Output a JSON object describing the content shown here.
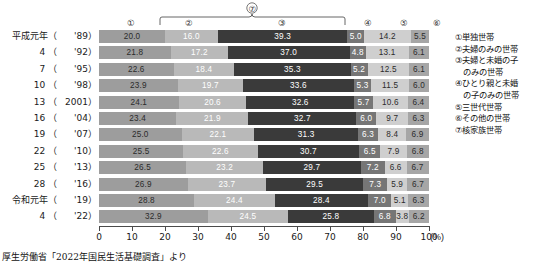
{
  "axis": {
    "ticks": [
      0,
      10,
      20,
      30,
      40,
      50,
      60,
      70,
      80,
      90,
      100
    ],
    "unit": "(%)",
    "min": 0,
    "max": 100
  },
  "bracket": {
    "label": "⑦",
    "spans": [
      "②",
      "③",
      "④"
    ]
  },
  "column_markers": [
    "①",
    "②",
    "③",
    "④",
    "⑤",
    "⑥"
  ],
  "legend": {
    "items": [
      {
        "key": "①単独世帯",
        "indent": false
      },
      {
        "key": "②夫婦のみの世帯",
        "indent": false
      },
      {
        "key": "③夫婦と未婚の子",
        "indent": false
      },
      {
        "key": "のみの世帯",
        "indent": true
      },
      {
        "key": "④ひとり親と未婚",
        "indent": false
      },
      {
        "key": "の子のみの世帯",
        "indent": true
      },
      {
        "key": "⑤三世代世帯",
        "indent": false
      },
      {
        "key": "⑥その他の世帯",
        "indent": false
      },
      {
        "key": "⑦核家族世帯",
        "indent": false
      }
    ]
  },
  "source": "厚生労働省「2022年国民生活基礎調査」より",
  "chart_data": {
    "type": "bar",
    "title": "",
    "xlabel": "(%)",
    "ylabel": "",
    "xlim": [
      0,
      100
    ],
    "grid": false,
    "orientation": "horizontal",
    "stacked": true,
    "legend_position": "right",
    "categories": [
      "平成元年（ '89）",
      "4 （ '92）",
      "7 （ '95）",
      "10 （ '98）",
      "13 （2001）",
      "16 （ '04）",
      "19 （ '07）",
      "22 （ '10）",
      "25 （ '13）",
      "28 （ '16）",
      "令和元年（ '19）",
      "4 （ '22）"
    ],
    "series": [
      {
        "name": "①単独世帯",
        "values": [
          20.0,
          21.8,
          22.6,
          23.9,
          24.1,
          23.4,
          25.0,
          25.5,
          26.5,
          26.9,
          28.8,
          32.9
        ]
      },
      {
        "name": "②夫婦のみの世帯",
        "values": [
          16.0,
          17.2,
          18.4,
          19.7,
          20.6,
          21.9,
          22.1,
          22.6,
          23.2,
          23.7,
          24.4,
          24.5
        ]
      },
      {
        "name": "③夫婦と未婚の子のみの世帯",
        "values": [
          39.3,
          37.0,
          35.3,
          33.6,
          32.6,
          32.7,
          31.3,
          30.7,
          29.7,
          29.5,
          28.4,
          25.8
        ]
      },
      {
        "name": "④ひとり親と未婚の子のみの世帯",
        "values": [
          5.0,
          4.8,
          5.2,
          5.3,
          5.7,
          6.0,
          6.3,
          6.5,
          7.2,
          7.3,
          7.0,
          6.8
        ]
      },
      {
        "name": "⑤三世代世帯",
        "values": [
          14.2,
          13.1,
          12.5,
          11.5,
          10.6,
          9.7,
          8.4,
          7.9,
          6.6,
          5.9,
          5.1,
          3.8
        ]
      },
      {
        "name": "⑥その他の世帯",
        "values": [
          5.5,
          6.1,
          6.1,
          6.0,
          6.4,
          6.3,
          6.9,
          6.8,
          6.7,
          6.7,
          6.3,
          6.2
        ]
      }
    ],
    "colors": [
      "#9d9d9d",
      "#b9b9b9",
      "#3a3a3a",
      "#767676",
      "#cfcfcf",
      "#a6a6a6"
    ],
    "rows": [
      {
        "era": "平成元年（",
        "yr": "'89）",
        "values": [
          20.0,
          16.0,
          39.3,
          5.0,
          14.2,
          5.5
        ]
      },
      {
        "era": "4 （",
        "yr": "'92）",
        "values": [
          21.8,
          17.2,
          37.0,
          4.8,
          13.1,
          6.1
        ]
      },
      {
        "era": "7 （",
        "yr": "'95）",
        "values": [
          22.6,
          18.4,
          35.3,
          5.2,
          12.5,
          6.1
        ]
      },
      {
        "era": "10 （",
        "yr": "'98）",
        "values": [
          23.9,
          19.7,
          33.6,
          5.3,
          11.5,
          6.0
        ]
      },
      {
        "era": "13 （",
        "yr": "2001）",
        "values": [
          24.1,
          20.6,
          32.6,
          5.7,
          10.6,
          6.4
        ]
      },
      {
        "era": "16 （",
        "yr": "'04）",
        "values": [
          23.4,
          21.9,
          32.7,
          6.0,
          9.7,
          6.3
        ]
      },
      {
        "era": "19 （",
        "yr": "'07）",
        "values": [
          25.0,
          22.1,
          31.3,
          6.3,
          8.4,
          6.9
        ]
      },
      {
        "era": "22 （",
        "yr": "'10）",
        "values": [
          25.5,
          22.6,
          30.7,
          6.5,
          7.9,
          6.8
        ]
      },
      {
        "era": "25 （",
        "yr": "'13）",
        "values": [
          26.5,
          23.2,
          29.7,
          7.2,
          6.6,
          6.7
        ]
      },
      {
        "era": "28 （",
        "yr": "'16）",
        "values": [
          26.9,
          23.7,
          29.5,
          7.3,
          5.9,
          6.7
        ]
      },
      {
        "era": "令和元年（",
        "yr": "'19）",
        "values": [
          28.8,
          24.4,
          28.4,
          7.0,
          5.1,
          6.3
        ]
      },
      {
        "era": "4 （",
        "yr": "'22）",
        "values": [
          32.9,
          24.5,
          25.8,
          6.8,
          3.8,
          6.2
        ]
      }
    ]
  }
}
